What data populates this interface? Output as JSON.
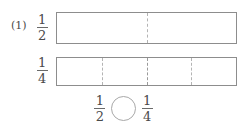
{
  "problem": {
    "number_label": "(1)"
  },
  "rows": [
    {
      "name": "half",
      "fraction": {
        "numerator": "1",
        "denominator": "2"
      },
      "parts": 2,
      "divider_positions_pct": [
        50
      ]
    },
    {
      "name": "quarter",
      "fraction": {
        "numerator": "1",
        "denominator": "4"
      },
      "parts": 4,
      "divider_positions_pct": [
        25,
        50,
        75
      ]
    }
  ],
  "comparison": {
    "left_fraction": {
      "numerator": "1",
      "denominator": "2"
    },
    "operator_placeholder": "circle",
    "right_fraction": {
      "numerator": "1",
      "denominator": "4"
    }
  },
  "colors": {
    "bar_border": "#8d8d8d",
    "divider": "#b4b4b4",
    "text": "#4a4a4a",
    "circle": "#a8a8a8",
    "background": "#ffffff"
  }
}
